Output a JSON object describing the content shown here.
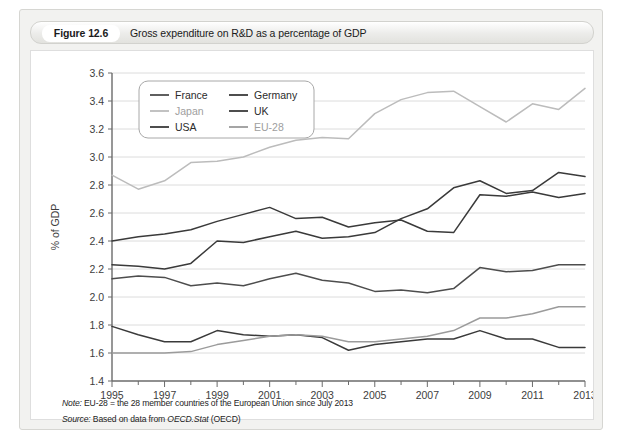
{
  "figure": {
    "number": "Figure 12.6",
    "caption": "Gross expenditure on R&D as a percentage of GDP"
  },
  "notes": {
    "note_label": "Note:",
    "note_text": " EU-28 = the 28 member countries of the European Union since July 2013",
    "source_label": "Source:",
    "source_text_before": " Based on data from ",
    "source_italic": "OECD.Stat",
    "source_text_after": " (OECD)"
  },
  "chart_data": {
    "type": "line",
    "title": "Gross expenditure on R&D as a percentage of GDP",
    "xlabel": "",
    "ylabel": "% of GDP",
    "ylim": [
      1.4,
      3.6
    ],
    "xlim": [
      1995,
      2013
    ],
    "ytick_step": 0.2,
    "grid": true,
    "legend_position": "top-left",
    "yticks": [
      "3.6",
      "3.4",
      "3.2",
      "3.0",
      "2.8",
      "2.6",
      "2.4",
      "2.2",
      "2.0",
      "1.8",
      "1.6",
      "1.4"
    ],
    "xticks": [
      "1995",
      "1997",
      "1999",
      "2001",
      "2003",
      "2005",
      "2007",
      "2009",
      "2011",
      "2013"
    ],
    "x": [
      1995,
      1996,
      1997,
      1998,
      1999,
      2000,
      2001,
      2002,
      2003,
      2004,
      2005,
      2006,
      2007,
      2008,
      2009,
      2010,
      2011,
      2012,
      2013
    ],
    "series": [
      {
        "name": "France",
        "color": "#4d4d4d",
        "values": [
          2.13,
          2.15,
          2.14,
          2.08,
          2.1,
          2.08,
          2.13,
          2.17,
          2.12,
          2.1,
          2.04,
          2.05,
          2.03,
          2.06,
          2.21,
          2.18,
          2.19,
          2.23,
          2.23
        ]
      },
      {
        "name": "Germany",
        "color": "#3a3a3a",
        "values": [
          2.4,
          2.43,
          2.45,
          2.48,
          2.54,
          2.59,
          2.64,
          2.56,
          2.57,
          2.5,
          2.53,
          2.55,
          2.47,
          2.46,
          2.73,
          2.72,
          2.75,
          2.71,
          2.74
        ]
      },
      {
        "name": "Japan",
        "color": "#bcbcbc",
        "values": [
          2.87,
          2.77,
          2.83,
          2.96,
          2.97,
          3.0,
          3.07,
          3.12,
          3.14,
          3.13,
          3.31,
          3.41,
          3.46,
          3.47,
          3.36,
          3.25,
          3.38,
          3.34,
          3.49
        ]
      },
      {
        "name": "UK",
        "color": "#3a3a3a",
        "values": [
          1.79,
          1.73,
          1.68,
          1.68,
          1.76,
          1.73,
          1.72,
          1.73,
          1.71,
          1.62,
          1.66,
          1.68,
          1.7,
          1.7,
          1.76,
          1.7,
          1.7,
          1.64,
          1.64
        ]
      },
      {
        "name": "USA",
        "color": "#3a3a3a",
        "values": [
          2.23,
          2.22,
          2.2,
          2.24,
          2.4,
          2.39,
          2.43,
          2.47,
          2.42,
          2.43,
          2.46,
          2.56,
          2.63,
          2.78,
          2.83,
          2.74,
          2.76,
          2.89,
          2.86
        ]
      },
      {
        "name": "EU-28",
        "color": "#9b9b9b",
        "values": [
          1.6,
          1.6,
          1.6,
          1.61,
          1.66,
          1.69,
          1.72,
          1.73,
          1.72,
          1.68,
          1.68,
          1.7,
          1.72,
          1.76,
          1.85,
          1.85,
          1.88,
          1.93,
          1.93
        ]
      }
    ],
    "legend": [
      {
        "label": "France",
        "color": "#4d4d4d"
      },
      {
        "label": "Germany",
        "color": "#3a3a3a"
      },
      {
        "label": "Japan",
        "color": "#bcbcbc"
      },
      {
        "label": "UK",
        "color": "#3a3a3a"
      },
      {
        "label": "USA",
        "color": "#3a3a3a"
      },
      {
        "label": "EU-28",
        "color": "#9b9b9b"
      }
    ]
  }
}
